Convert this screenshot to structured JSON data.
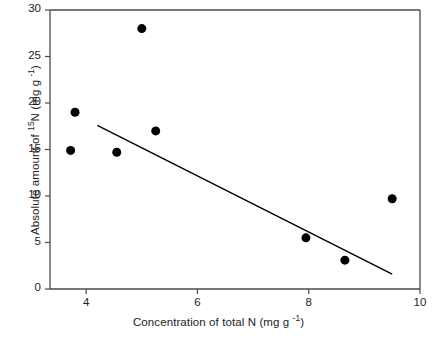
{
  "chart_data": {
    "type": "scatter",
    "title": "",
    "xlabel": "Concentration of total N (mg  g -1)",
    "xlabel_parts": {
      "main": "Concentration of total N (mg  g ",
      "sup": "-1",
      "tail": ")"
    },
    "ylabel": "Absolute amount of 15N (mg g -1)",
    "ylabel_parts": {
      "pre": "Absolute amount of ",
      "sup1": "15",
      "mid": "N (mg g ",
      "sup2": "-1",
      "tail": ")"
    },
    "xlim": [
      3.35,
      10
    ],
    "ylim": [
      0,
      30
    ],
    "xticks": [
      4,
      6,
      8,
      10
    ],
    "xtick_labels": [
      "4",
      "6",
      "8",
      "10"
    ],
    "yticks": [
      0,
      5,
      10,
      15,
      20,
      25,
      30
    ],
    "ytick_labels": [
      "0",
      "5",
      "10",
      "15",
      "20",
      "25",
      "30"
    ],
    "grid": false,
    "legend": false,
    "marker": "filled-circle",
    "marker_color": "#000000",
    "marker_size_px": 9,
    "axis_color": "#4a4a4a",
    "line_color": "#000000",
    "points": [
      {
        "x": 3.72,
        "y": 14.9
      },
      {
        "x": 3.8,
        "y": 19.0
      },
      {
        "x": 4.55,
        "y": 14.7
      },
      {
        "x": 5.0,
        "y": 28.0
      },
      {
        "x": 5.25,
        "y": 17.0
      },
      {
        "x": 7.95,
        "y": 5.5
      },
      {
        "x": 8.65,
        "y": 3.1
      },
      {
        "x": 9.5,
        "y": 9.7
      }
    ],
    "trendline": {
      "type": "linear-fit",
      "x_start": 4.2,
      "y_start": 17.6,
      "x_end": 9.5,
      "y_end": 1.6
    }
  }
}
